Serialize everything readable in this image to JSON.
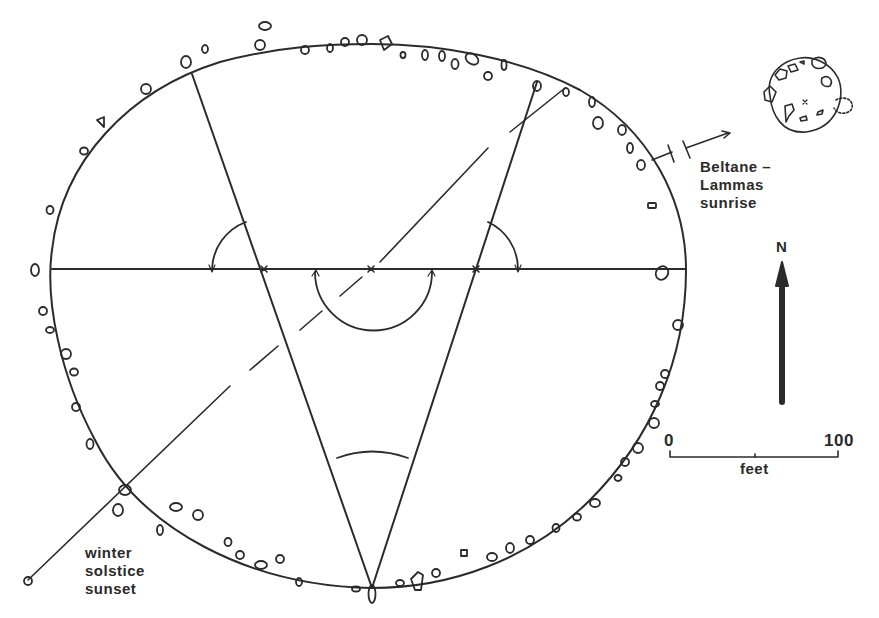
{
  "labels": {
    "beltane_line1": "Beltane –",
    "beltane_line2": "Lammas",
    "beltane_line3": "sunrise",
    "winter_line1": "winter",
    "winter_line2": "solstice",
    "winter_line3": "sunset",
    "north": "N",
    "scale_zero": "0",
    "scale_hundred": "100",
    "scale_unit": "feet"
  },
  "colors": {
    "ink": "#2b2b2b",
    "paper": "#ffffff"
  }
}
